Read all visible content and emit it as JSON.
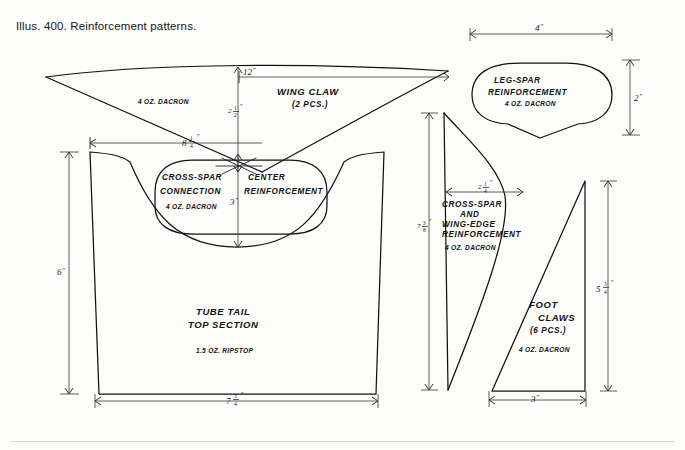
{
  "page": {
    "caption": "Illus. 400. Reinforcement patterns.",
    "background_color": "#fdfdfb",
    "ink_color": "#111111"
  },
  "parts": [
    {
      "id": "wing-claw",
      "title_line1": "WING CLAW",
      "title_line2": "(2 PCS.)",
      "material": "4 OZ. DACRON",
      "shape": "thin curved triangle / swept claw",
      "dimensions": [
        {
          "label": "12\"",
          "value": 12,
          "unit": "in",
          "orientation": "horizontal",
          "name": "wing-claw-length"
        },
        {
          "label": "2½\"",
          "value": 2.5,
          "unit": "in",
          "orientation": "vertical",
          "name": "wing-claw-height"
        },
        {
          "label": "8¼\"",
          "value": 8.25,
          "unit": "in",
          "orientation": "horizontal",
          "name": "wing-claw-lower-span"
        }
      ]
    },
    {
      "id": "leg-spar-reinforcement",
      "title_line1": "LEG-SPAR",
      "title_line2": "REINFORCEMENT",
      "material": "4 OZ. DACRON",
      "shape": "rounded lozenge with lower point",
      "dimensions": [
        {
          "label": "4\"",
          "value": 4,
          "unit": "in",
          "orientation": "horizontal",
          "name": "leg-spar-width"
        },
        {
          "label": "2\"",
          "value": 2,
          "unit": "in",
          "orientation": "vertical",
          "name": "leg-spar-height"
        }
      ]
    },
    {
      "id": "center-reinforcement",
      "title_line1": "CROSS-SPAR",
      "title_line2": "CONNECTION",
      "title_line3": "CENTER",
      "title_line4": "REINFORCEMENT",
      "material": "4 OZ. DACRON",
      "shape": "rounded stadium / oblong patch",
      "dimensions": [
        {
          "label": "3\"",
          "value": 3,
          "unit": "in",
          "orientation": "vertical",
          "name": "center-reinforcement-depth"
        }
      ]
    },
    {
      "id": "tube-tail-top-section",
      "title_line1": "TUBE TAIL",
      "title_line2": "TOP SECTION",
      "material": "1.5 OZ. RIPSTOP",
      "shape": "trapezoid with concave scooped top edge",
      "dimensions": [
        {
          "label": "6\"",
          "value": 6,
          "unit": "in",
          "orientation": "vertical",
          "name": "tube-tail-height"
        },
        {
          "label": "7¾\"",
          "value": 7.75,
          "unit": "in",
          "orientation": "horizontal",
          "name": "tube-tail-bottom-width"
        },
        {
          "label": "8¼\"",
          "value": 8.25,
          "unit": "in",
          "orientation": "horizontal",
          "name": "tube-tail-top-width"
        }
      ]
    },
    {
      "id": "cross-spar-wing-edge-reinforcement",
      "title_line1": "CROSS-SPAR",
      "title_line2": "AND",
      "title_line3": "WING-EDGE",
      "title_line4": "REINFORCEMENT",
      "material": "4 OZ. DACRON",
      "shape": "tall curved sail / sickle shape",
      "dimensions": [
        {
          "label": "7⅜\"",
          "value": 7.375,
          "unit": "in",
          "orientation": "vertical",
          "name": "cross-spar-height"
        },
        {
          "label": "2¼\"",
          "value": 2.25,
          "unit": "in",
          "orientation": "horizontal",
          "name": "cross-spar-width"
        }
      ]
    },
    {
      "id": "foot-claws",
      "title_line1": "FOOT",
      "title_line2": "CLAWS",
      "title_line3": "(6 PCS.)",
      "material": "4 OZ. DACRON",
      "shape": "right triangle",
      "dimensions": [
        {
          "label": "5¾\"",
          "value": 5.75,
          "unit": "in",
          "orientation": "vertical",
          "name": "foot-claws-height"
        },
        {
          "label": "3\"",
          "value": 3,
          "unit": "in",
          "orientation": "horizontal",
          "name": "foot-claws-base"
        }
      ]
    }
  ],
  "dimension_labels": {
    "wing_claw_length": "12",
    "wing_claw_height_whole": "2",
    "wing_claw_height_num": "1",
    "wing_claw_height_den": "2",
    "wing_claw_span_whole": "8",
    "wing_claw_span_num": "1",
    "wing_claw_span_den": "4",
    "leg_spar_width": "4",
    "leg_spar_height": "2",
    "center_depth": "3",
    "tube_tail_height": "6",
    "tube_tail_bottom_whole": "7",
    "tube_tail_bottom_num": "3",
    "tube_tail_bottom_den": "4",
    "cross_spar_height_whole": "7",
    "cross_spar_height_num": "3",
    "cross_spar_height_den": "8",
    "cross_spar_width_whole": "2",
    "cross_spar_width_num": "1",
    "cross_spar_width_den": "4",
    "foot_claw_height_whole": "5",
    "foot_claw_height_num": "3",
    "foot_claw_height_den": "4",
    "foot_claw_base": "3",
    "inch_mark": "”"
  },
  "labels": {
    "dacron": "4 OZ. DACRON",
    "ripstop": "1.5 OZ. RIPSTOP",
    "wing_claw": "WING CLAW",
    "wing_claw_qty": "(2 PCS.)",
    "leg_spar_1": "LEG-SPAR",
    "leg_spar_2": "REINFORCEMENT",
    "cross_spar_conn_1": "CROSS-SPAR",
    "cross_spar_conn_2": "CONNECTION",
    "center_1": "CENTER",
    "center_2": "REINFORCEMENT",
    "tube_tail_1": "TUBE TAIL",
    "tube_tail_2": "TOP SECTION",
    "cs_we_1": "CROSS-SPAR",
    "cs_we_2": "AND",
    "cs_we_3": "WING-EDGE",
    "cs_we_4": "REINFORCEMENT",
    "foot_1": "FOOT",
    "foot_2": "CLAWS",
    "foot_qty": "(6 PCS.)"
  }
}
